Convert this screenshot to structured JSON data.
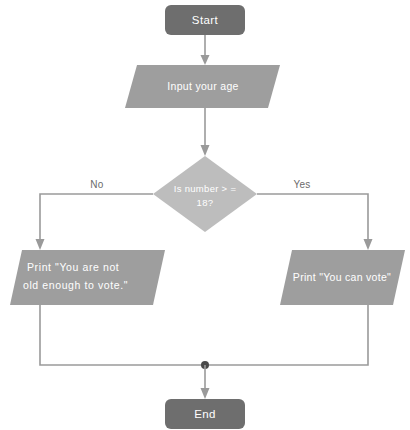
{
  "diagram": {
    "colors": {
      "terminator_fill": "#6e6e6e",
      "process_fill": "#9e9e9e",
      "decision_fill": "#bdbdbd",
      "connector": "#9a9a9a",
      "junction": "#4a4a4a",
      "node_text": "#ffffff",
      "edge_label_text": "#6b6b6b",
      "background": "#ffffff"
    },
    "nodes": {
      "start": {
        "label": "Start",
        "shape": "terminator"
      },
      "input_age": {
        "label": "Input your age",
        "shape": "parallelogram"
      },
      "decision": {
        "label_line1": "Is number > =",
        "label_line2": "18?",
        "shape": "diamond"
      },
      "print_not_old_enough": {
        "label_line1": "Print \"You are not",
        "label_line2": "old enough to vote.\"",
        "shape": "parallelogram"
      },
      "print_can_vote": {
        "label": "Print \"You can vote\"",
        "shape": "parallelogram"
      },
      "end": {
        "label": "End",
        "shape": "terminator"
      }
    },
    "edges": {
      "no_label": "No",
      "yes_label": "Yes"
    }
  }
}
